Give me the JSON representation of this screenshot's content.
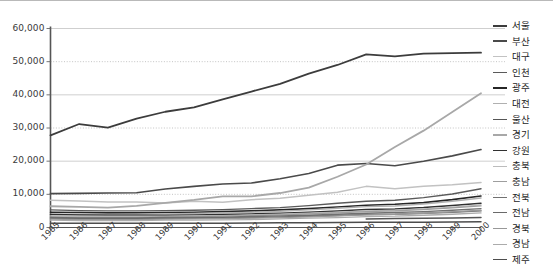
{
  "chart_data": {
    "type": "line",
    "title": "",
    "xlabel": "",
    "ylabel": "",
    "grid": true,
    "legend_position": "right",
    "ylim": [
      0,
      60000
    ],
    "ytick_labels": [
      "60,000",
      "50,000",
      "40,000",
      "30,000",
      "20,000",
      "10,000",
      "0"
    ],
    "ytick_values": [
      60000,
      50000,
      40000,
      30000,
      20000,
      10000,
      0
    ],
    "categories": [
      "1985",
      "1986",
      "1987",
      "1988",
      "1989",
      "1990",
      "1991",
      "1992",
      "1993",
      "1994",
      "1995",
      "1996",
      "1997",
      "1998",
      "1999",
      "2000"
    ],
    "series": [
      {
        "name": "서울",
        "color": "#3c3c3c",
        "width": 1.8,
        "values": [
          27800,
          31200,
          30100,
          32800,
          34900,
          36200,
          38600,
          41000,
          43300,
          46400,
          49000,
          52200,
          51600,
          52400,
          52600,
          52700
        ]
      },
      {
        "name": "부산",
        "color": "#4a4a4a",
        "width": 1.6,
        "values": [
          10200,
          10300,
          10400,
          10500,
          11600,
          12400,
          13100,
          13400,
          14700,
          16300,
          18800,
          19300,
          18600,
          20000,
          21600,
          23500
        ]
      },
      {
        "name": "대구",
        "color": "#c2c2c2",
        "width": 1.5,
        "values": [
          8200,
          8000,
          7700,
          7700,
          7400,
          7900,
          7600,
          8400,
          8800,
          9700,
          10600,
          12400,
          11700,
          12400,
          12900,
          13600
        ]
      },
      {
        "name": "인천",
        "color": "#5a5a5a",
        "width": 1.4,
        "values": [
          5300,
          5100,
          5000,
          5000,
          5100,
          5200,
          5400,
          5700,
          6000,
          6600,
          7300,
          7900,
          8200,
          9000,
          10100,
          11700
        ]
      },
      {
        "name": "광주",
        "color": "#262626",
        "width": 1.6,
        "values": [
          4600,
          4500,
          4400,
          4400,
          4500,
          4600,
          4800,
          5000,
          5300,
          5700,
          6200,
          6700,
          7000,
          7500,
          8400,
          9500
        ]
      },
      {
        "name": "대전",
        "color": "#b0b0b0",
        "width": 1.4,
        "values": [
          4000,
          4000,
          3900,
          4000,
          4100,
          4200,
          4400,
          4600,
          4900,
          5300,
          5800,
          6300,
          6500,
          7100,
          7900,
          8900
        ]
      },
      {
        "name": "울산",
        "color": "#555555",
        "width": 1.5,
        "values": [
          null,
          null,
          null,
          null,
          null,
          null,
          null,
          null,
          null,
          null,
          null,
          2600,
          2700,
          2800,
          2900,
          3000
        ]
      },
      {
        "name": "경기",
        "color": "#a8a8a8",
        "width": 1.8,
        "values": [
          6400,
          6200,
          6000,
          6500,
          7400,
          8300,
          9400,
          9400,
          10400,
          12000,
          15300,
          19000,
          24300,
          29200,
          34800,
          40500
        ]
      },
      {
        "name": "강원",
        "color": "#303030",
        "width": 1.5,
        "values": [
          3900,
          3800,
          3700,
          3700,
          3700,
          3800,
          3900,
          4100,
          4300,
          4600,
          5000,
          5400,
          5600,
          6000,
          6600,
          7300
        ]
      },
      {
        "name": "충북",
        "color": "#bcbcbc",
        "width": 1.3,
        "values": [
          3500,
          3400,
          3400,
          3400,
          3400,
          3500,
          3600,
          3800,
          4000,
          4300,
          4600,
          5000,
          5200,
          5600,
          6100,
          6800
        ]
      },
      {
        "name": "충남",
        "color": "#9e9e9e",
        "width": 1.3,
        "values": [
          3200,
          3100,
          3100,
          3100,
          3200,
          3300,
          3400,
          3600,
          3800,
          4100,
          4400,
          4800,
          5000,
          5400,
          5900,
          6500
        ]
      },
      {
        "name": "전북",
        "color": "#717171",
        "width": 1.4,
        "values": [
          3000,
          2900,
          2900,
          2900,
          3000,
          3000,
          3100,
          3300,
          3500,
          3700,
          4000,
          4300,
          4500,
          4800,
          5200,
          5700
        ]
      },
      {
        "name": "전남",
        "color": "#6a6a6a",
        "width": 1.4,
        "values": [
          2800,
          2700,
          2700,
          2700,
          2700,
          2800,
          2900,
          3000,
          3200,
          3400,
          3600,
          3900,
          4000,
          4300,
          4600,
          5000
        ]
      },
      {
        "name": "경북",
        "color": "#989898",
        "width": 1.3,
        "values": [
          2500,
          2400,
          2400,
          2400,
          2500,
          2600,
          2700,
          2800,
          3000,
          3200,
          3500,
          3800,
          4000,
          4300,
          4700,
          5200
        ]
      },
      {
        "name": "경남",
        "color": "#ababab",
        "width": 1.3,
        "values": [
          2200,
          2100,
          2100,
          2100,
          2200,
          2200,
          2300,
          2400,
          2600,
          2800,
          3000,
          3300,
          3400,
          3700,
          4000,
          4400
        ]
      },
      {
        "name": "제주",
        "color": "#4d4d4d",
        "width": 1.5,
        "values": [
          1300,
          1250,
          1250,
          1250,
          1250,
          1280,
          1300,
          1350,
          1400,
          1450,
          1500,
          1550,
          1580,
          1620,
          1680,
          1750
        ]
      }
    ]
  }
}
